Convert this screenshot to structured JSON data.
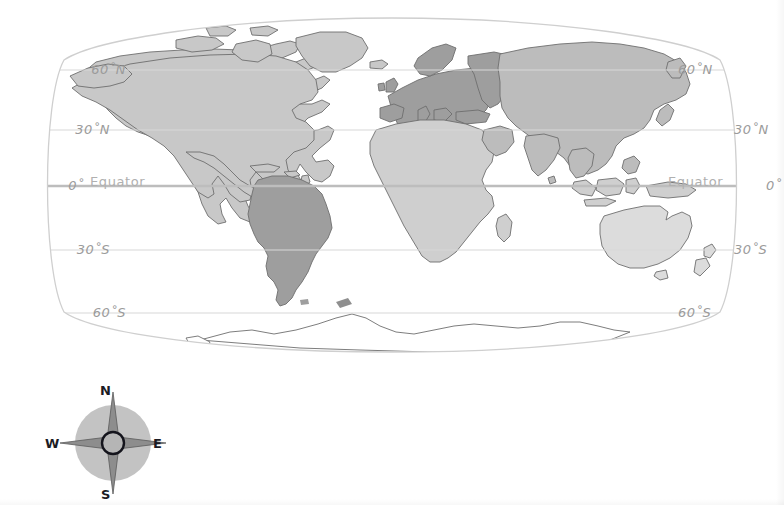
{
  "figure": {
    "type": "world-map",
    "projection": "oval / Robinson-like",
    "background_color": "#ffffff"
  },
  "map": {
    "name": "world-map",
    "outline_color": "#cfcfcf",
    "graticule": {
      "line_color": "#d8d8d8",
      "equator_line_color": "#c2c2c2",
      "latitudes": [
        {
          "id": "lat-60n",
          "label_left": "60˚N",
          "label_right": "60˚N",
          "y": 70
        },
        {
          "id": "lat-30n",
          "label_left": "30˚N",
          "label_right": "30˚N",
          "y": 130
        },
        {
          "id": "lat-0",
          "label_left": "0˚",
          "label_right": "0˚",
          "y": 186,
          "name": "Equator"
        },
        {
          "id": "lat-30s",
          "label_left": "30˚S",
          "label_right": "30˚S",
          "y": 250
        },
        {
          "id": "lat-60s",
          "label_left": "60˚S",
          "label_right": "60˚S",
          "y": 313
        }
      ],
      "equator_text_left": "Equator",
      "equator_text_right": "Equator"
    },
    "landmasses": [
      {
        "name": "north-america",
        "shade": "#c8c8c8"
      },
      {
        "name": "greenland",
        "shade": "#c8c8c8"
      },
      {
        "name": "south-america",
        "shade": "#9e9e9e"
      },
      {
        "name": "europe",
        "shade": "#9e9e9e"
      },
      {
        "name": "africa",
        "shade": "#cfcfcf"
      },
      {
        "name": "asia",
        "shade": "#bcbcbc"
      },
      {
        "name": "australia",
        "shade": "#dcdcdc"
      },
      {
        "name": "antarctica",
        "shade": "#ffffff"
      }
    ]
  },
  "compass": {
    "name": "compass-rose",
    "disc_color": "#b9b9b9",
    "star_color": "#8a8a8a",
    "hub_color": "#b0b0b0",
    "hub_ring_color": "#1c1c24",
    "directions": {
      "north": "N",
      "east": "E",
      "south": "S",
      "west": "W"
    }
  }
}
